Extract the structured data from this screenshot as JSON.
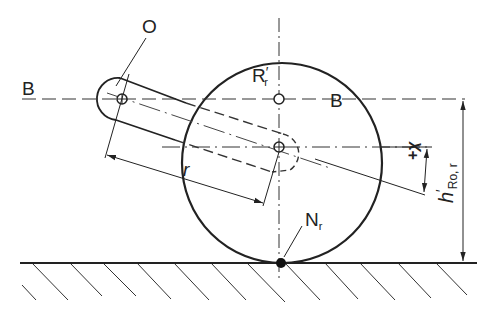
{
  "diagram": {
    "type": "technical-drawing",
    "stroke_color": "#222222",
    "background": "#ffffff",
    "labels": {
      "pivot": "O",
      "axis_left": "B",
      "axis_right": "B",
      "wheel_center_main": "R",
      "wheel_center_sub": "r",
      "wheel_center_prime": "′",
      "contact_main": "N",
      "contact_sub": "r",
      "radius": "r",
      "offset_sign": "+",
      "offset_symbol": "χ",
      "height_main": "h",
      "height_prime": "′",
      "height_sub": "Ro, r"
    },
    "elements": [
      {
        "name": "wheel",
        "kind": "circle",
        "cx": 282,
        "cy": 163,
        "r": 100
      },
      {
        "name": "ground-line",
        "kind": "line",
        "y": 263
      },
      {
        "name": "axis-B",
        "kind": "dash-line",
        "y": 99
      },
      {
        "name": "lower-center-axis",
        "kind": "dash-dot-line",
        "y": 147
      },
      {
        "name": "arm-solid",
        "kind": "slotted-link",
        "pivot": [
          122,
          99
        ]
      },
      {
        "name": "arm-hidden",
        "kind": "dashed-slotted-link",
        "pivot": [
          282,
          147
        ]
      },
      {
        "name": "contact-point",
        "kind": "filled-dot",
        "cx": 282,
        "cy": 263
      }
    ]
  }
}
